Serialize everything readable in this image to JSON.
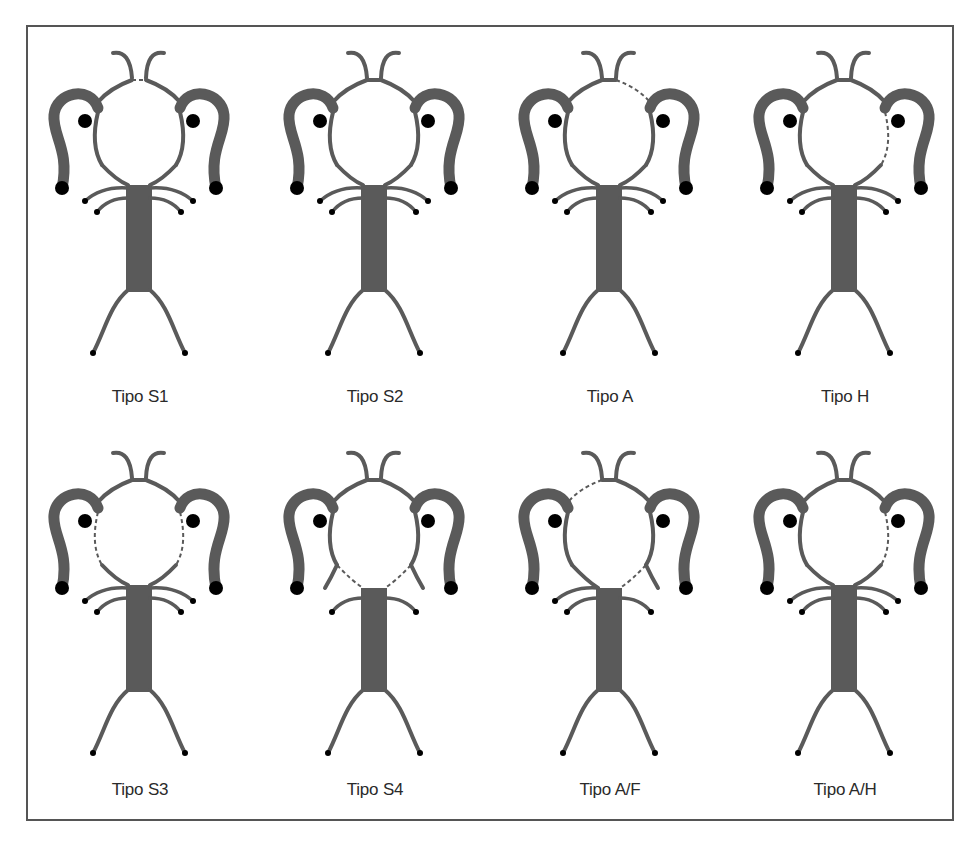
{
  "figure": {
    "colors": {
      "vessel": "#5a5a5a",
      "node": "#000000",
      "frame": "#555555",
      "label": "#2a2a2a"
    },
    "legend_note": "dashed = hypoplastic/absent segment",
    "panels": [
      {
        "id": "s1",
        "label": "Tipo S1",
        "col": 0,
        "row": 0,
        "dashed": [
          "acom"
        ],
        "fetal": [],
        "upper_branches": [
          "left",
          "right"
        ]
      },
      {
        "id": "s2",
        "label": "Tipo S2",
        "col": 1,
        "row": 0,
        "dashed": [],
        "fetal": [],
        "upper_branches": [
          "left",
          "right"
        ]
      },
      {
        "id": "a",
        "label": "Tipo A",
        "col": 2,
        "row": 0,
        "dashed": [
          "a1_right"
        ],
        "fetal": [],
        "upper_branches": [
          "left",
          "right"
        ]
      },
      {
        "id": "h",
        "label": "Tipo H",
        "col": 3,
        "row": 0,
        "dashed": [
          "pcom_right"
        ],
        "fetal": [],
        "upper_branches": [
          "left",
          "right"
        ]
      },
      {
        "id": "s3",
        "label": "Tipo S3",
        "col": 0,
        "row": 1,
        "dashed": [
          "pcom_left",
          "pcom_right"
        ],
        "fetal": [],
        "upper_branches": [
          "left",
          "right"
        ]
      },
      {
        "id": "s4",
        "label": "Tipo S4",
        "col": 1,
        "row": 1,
        "dashed": [
          "p1_left",
          "p1_right"
        ],
        "fetal": [
          "left",
          "right"
        ],
        "upper_branches": []
      },
      {
        "id": "af",
        "label": "Tipo A/F",
        "col": 2,
        "row": 1,
        "dashed": [
          "a1_left",
          "p1_right"
        ],
        "fetal": [
          "right"
        ],
        "upper_branches": [
          "left"
        ]
      },
      {
        "id": "ah",
        "label": "Tipo A/H",
        "col": 3,
        "row": 1,
        "dashed": [
          "pcom_right"
        ],
        "fetal": [],
        "upper_branches": [
          "left",
          "right"
        ]
      }
    ]
  }
}
